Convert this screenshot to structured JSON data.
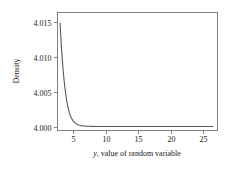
{
  "chart_data": {
    "type": "line",
    "title": "",
    "subtitle": "",
    "xlabel_prefix": "y",
    "xlabel_suffix": ", value of random variable",
    "xlabel": "y, value of random variable",
    "ylabel": "Density",
    "xlim": [
      2.6,
      27.2
    ],
    "ylim": [
      3.9995,
      4.0163
    ],
    "grid": false,
    "legend": null,
    "x_ticks": [
      5,
      10,
      15,
      20,
      25
    ],
    "x_tick_labels": [
      "5",
      "10",
      "15",
      "20",
      "25"
    ],
    "y_ticks": [
      4.0,
      4.005,
      4.01,
      4.015
    ],
    "y_tick_labels": [
      "4.000",
      "4.005",
      "4.010",
      "4.015"
    ],
    "series": [
      {
        "name": "density",
        "color": "#595959",
        "x": [
          3.0,
          3.1,
          3.2,
          3.3,
          3.4,
          3.5,
          3.6,
          3.7,
          3.8,
          3.9,
          4.0,
          4.2,
          4.4,
          4.6,
          4.8,
          5.0,
          5.25,
          5.5,
          5.75,
          6.0,
          6.25,
          6.5,
          6.75,
          7.0,
          7.5,
          8.0,
          8.5,
          9.0,
          9.5,
          10.0,
          11.0,
          12.0,
          13.0,
          14.0,
          15.0,
          16.0,
          17.0,
          18.0,
          19.0,
          20.0,
          21.0,
          22.0,
          23.0,
          24.0,
          25.0,
          26.0,
          26.5
        ],
        "y": [
          4.0148,
          4.013,
          4.01144,
          4.01005,
          4.00882,
          4.00772,
          4.00674,
          4.00587,
          4.00509,
          4.0044,
          4.00379,
          4.00279,
          4.00204,
          4.00149,
          4.00109,
          4.0008,
          4.00054,
          4.00037,
          4.00026,
          4.00018,
          4.00013,
          4.00009,
          4.00007,
          4.00005,
          4.00003,
          4.00002,
          4.00001,
          4.00001,
          4.00001,
          4.0,
          4.0,
          4.0,
          4.0,
          4.0,
          4.0,
          4.0,
          4.0,
          4.0,
          4.0,
          4.0,
          4.0,
          4.0,
          4.0,
          4.0,
          4.0,
          4.0,
          4.0
        ]
      }
    ],
    "colors": {
      "curve": "#595959",
      "frame": "#808080",
      "background": "#ffffff",
      "text": "#1a1a1a"
    }
  }
}
